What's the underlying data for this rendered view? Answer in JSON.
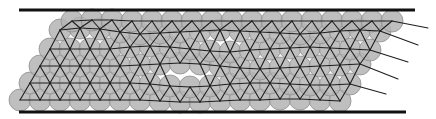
{
  "figure": {
    "width": 436,
    "height": 119,
    "colors": {
      "background": "#ffffff",
      "disk_fill": "#b4b4b4",
      "disk_stroke": "#8e8e8e",
      "bond": "#1e1e1e",
      "wall": "#111111"
    },
    "walls": [
      {
        "name": "top-wall",
        "x1": 19,
        "x2": 415,
        "y": 10
      },
      {
        "name": "bottom-wall",
        "x1": 19,
        "x2": 406,
        "y": 112
      }
    ],
    "disk_radius": 11,
    "lattice_spacing": 20,
    "rows": [
      {
        "y": 100,
        "x_start": 20,
        "x_end": 340,
        "wave": [
          0,
          0,
          0,
          0,
          0,
          0,
          0,
          1,
          2,
          2,
          1,
          0,
          0,
          -1,
          -1,
          0,
          1
        ]
      },
      {
        "y": 83,
        "x_start": 30,
        "x_end": 366,
        "wave": [
          0,
          0,
          0,
          0,
          0,
          0,
          1,
          3,
          4,
          3,
          1,
          0,
          0,
          1,
          2,
          2,
          1,
          0
        ]
      },
      {
        "y": 66,
        "x_start": 40,
        "x_end": 376,
        "wave": [
          0,
          0,
          0,
          0,
          0,
          -1,
          -2,
          -3,
          -2,
          0,
          2,
          3,
          2,
          1,
          0,
          -1,
          -2,
          0
        ]
      },
      {
        "y": 49,
        "x_start": 50,
        "x_end": 386,
        "wave": [
          0,
          0,
          0,
          0,
          -2,
          -3,
          -2,
          0,
          2,
          3,
          1,
          0,
          -1,
          -2,
          -1,
          0,
          1,
          0
        ]
      },
      {
        "y": 32,
        "x_start": 60,
        "x_end": 396,
        "wave": [
          -2,
          -4,
          -3,
          0,
          2,
          1,
          0,
          -1,
          -2,
          -1,
          0,
          1,
          2,
          1,
          -1,
          -2,
          -1,
          0
        ]
      },
      {
        "y": 21,
        "x_start": 72,
        "x_end": 404,
        "wave": [
          0,
          -1,
          -1,
          0,
          0,
          0,
          0,
          0,
          0,
          0,
          0,
          0,
          0,
          0,
          0,
          0,
          0,
          0
        ]
      }
    ],
    "bond_tails": [
      {
        "row": 5,
        "x2": 428,
        "y2": 28
      },
      {
        "row": 4,
        "x2": 418,
        "y2": 45
      },
      {
        "row": 3,
        "x2": 408,
        "y2": 62
      },
      {
        "row": 2,
        "x2": 398,
        "y2": 79
      },
      {
        "row": 1,
        "x2": 386,
        "y2": 94
      }
    ]
  }
}
